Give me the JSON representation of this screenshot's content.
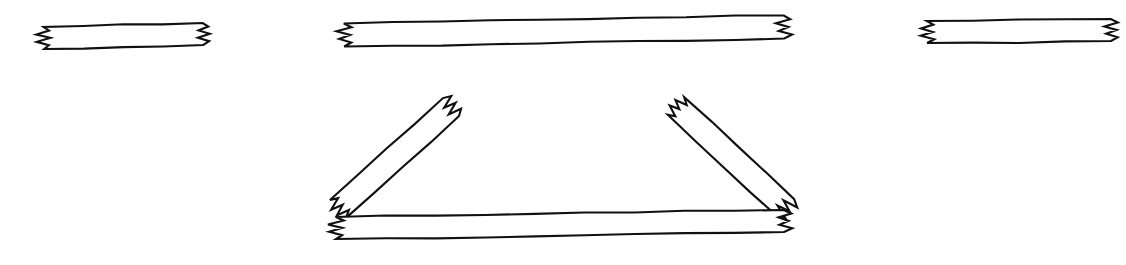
{
  "canvas": {
    "width": 1126,
    "height": 265,
    "background_color": "#ffffff",
    "stroke_color": "#111111",
    "stroke_width": 2.1
  },
  "diagram": {
    "style": "line-art outline, black on white",
    "groups": [
      {
        "name": "top-row",
        "label": "Top row of three horizontal bars",
        "members": [
          "bar-short-left",
          "bar-long-center",
          "bar-short-right"
        ]
      },
      {
        "name": "triangle-assembly",
        "label": "Triangular tent assembly of three bars",
        "members": [
          "bar-diagonal-left",
          "bar-diagonal-right",
          "bar-base-bottom"
        ]
      }
    ],
    "shapes": [
      {
        "id": "bar-short-left",
        "name": "bar-short-left",
        "kind": "broken-bar",
        "orientation": "horizontal",
        "group": "top-row",
        "end_style": "zigzag-break",
        "break_ends": [
          "left",
          "right"
        ],
        "geometry": {
          "x1": 44,
          "y1": 38,
          "x2": 203,
          "y2": 34,
          "thickness": 22,
          "zigzag_teeth": 3,
          "zigzag_amplitude": 7
        }
      },
      {
        "id": "bar-long-center",
        "name": "bar-long-center",
        "kind": "broken-bar",
        "orientation": "horizontal",
        "group": "top-row",
        "end_style": "zigzag-break",
        "break_ends": [
          "left",
          "right"
        ],
        "geometry": {
          "x1": 344,
          "y1": 35,
          "x2": 784,
          "y2": 27,
          "thickness": 23,
          "zigzag_teeth": 3,
          "zigzag_amplitude": 7
        }
      },
      {
        "id": "bar-short-right",
        "name": "bar-short-right",
        "kind": "broken-bar",
        "orientation": "horizontal",
        "group": "top-row",
        "end_style": "zigzag-break",
        "break_ends": [
          "left",
          "right"
        ],
        "geometry": {
          "x1": 927,
          "y1": 32,
          "x2": 1111,
          "y2": 30,
          "thickness": 22,
          "zigzag_teeth": 3,
          "zigzag_amplitude": 7
        }
      },
      {
        "id": "bar-diagonal-left",
        "name": "bar-diagonal-left",
        "kind": "broken-bar",
        "orientation": "diagonal-up-right",
        "group": "triangle-assembly",
        "end_style": "zigzag-break",
        "break_ends": [
          "lower-left",
          "upper-right"
        ],
        "geometry": {
          "x1": 338,
          "y1": 209,
          "x2": 451,
          "y2": 107,
          "thickness": 24,
          "zigzag_teeth": 3,
          "zigzag_amplitude": 7
        }
      },
      {
        "id": "bar-diagonal-right",
        "name": "bar-diagonal-right",
        "kind": "broken-bar",
        "orientation": "diagonal-down-right",
        "group": "triangle-assembly",
        "end_style": "zigzag-break",
        "break_ends": [
          "upper-left",
          "lower-right"
        ],
        "geometry": {
          "x1": 676,
          "y1": 106,
          "x2": 786,
          "y2": 208,
          "thickness": 24,
          "zigzag_teeth": 3,
          "zigzag_amplitude": 7
        }
      },
      {
        "id": "bar-base-bottom",
        "name": "bar-base-bottom",
        "kind": "broken-bar",
        "orientation": "horizontal",
        "group": "triangle-assembly",
        "end_style": "zigzag-break",
        "break_ends": [
          "left",
          "right"
        ],
        "geometry": {
          "x1": 336,
          "y1": 228,
          "x2": 784,
          "y2": 221,
          "thickness": 22,
          "zigzag_teeth": 3,
          "zigzag_amplitude": 7
        }
      }
    ]
  }
}
